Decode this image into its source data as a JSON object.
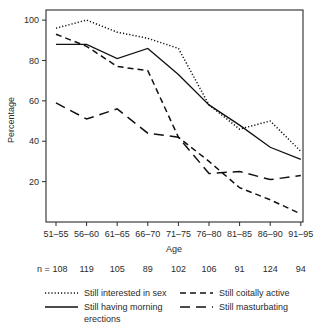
{
  "chart_data": {
    "type": "line",
    "title": "",
    "xlabel": "Age",
    "ylabel": "Percentage",
    "categories": [
      "51–55",
      "56–60",
      "61–65",
      "66–70",
      "71–75",
      "76–80",
      "81–85",
      "86–90",
      "91–95"
    ],
    "ylim": [
      0,
      105
    ],
    "yticks": [
      20,
      40,
      60,
      80,
      100
    ],
    "ytick_labels": [
      "20",
      "40",
      "60",
      "80",
      "100"
    ],
    "grid": false,
    "legend_position": "below",
    "sample_size_prefix": "n =",
    "sample_sizes": [
      108,
      119,
      105,
      89,
      102,
      106,
      91,
      124,
      94
    ],
    "series": [
      {
        "name": "Still interested in sex",
        "line_style": "dotted",
        "color": "#111111",
        "values": [
          96,
          100,
          94,
          91,
          86,
          58,
          46,
          50,
          35
        ]
      },
      {
        "name": "Still having morning erections",
        "line_style": "solid",
        "color": "#111111",
        "values": [
          88,
          88,
          81,
          86,
          73,
          58,
          48,
          37,
          31
        ]
      },
      {
        "name": "Still coitally active",
        "line_style": "dashed",
        "color": "#111111",
        "values": [
          93,
          87,
          77,
          75,
          42,
          30,
          17,
          11,
          4
        ]
      },
      {
        "name": "Still masturbating",
        "line_style": "longdash",
        "color": "#111111",
        "values": [
          59,
          51,
          56,
          44,
          42,
          24,
          25,
          21,
          23
        ]
      }
    ]
  },
  "legend": {
    "entries": [
      {
        "label": "Still interested in sex",
        "style": "dotted"
      },
      {
        "label": "Still coitally active",
        "style": "dashed"
      },
      {
        "label": "Still having morning erections",
        "style": "solid",
        "line1": "Still having morning",
        "line2": "erections"
      },
      {
        "label": "Still masturbating",
        "style": "longdash"
      }
    ]
  }
}
